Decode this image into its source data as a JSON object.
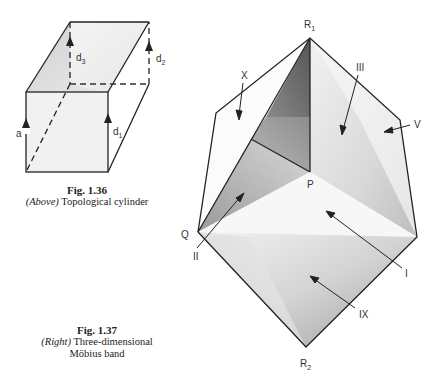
{
  "fig36": {
    "number": "Fig. 1.36",
    "qualifier": "(Above)",
    "title": "Topological cylinder",
    "labels": {
      "a": "a",
      "d1": "d",
      "d1_sub": "1",
      "d2": "d",
      "d2_sub": "2",
      "d3": "d",
      "d3_sub": "3"
    }
  },
  "fig37": {
    "number": "Fig. 1.37",
    "qualifier": "(Right)",
    "title_line1": "Three-dimensional",
    "title_line2": "Möbius band",
    "labels": {
      "R1": "R",
      "R1_sub": "1",
      "R2": "R",
      "R2_sub": "2",
      "P": "P",
      "Q": "Q",
      "X": "X",
      "III": "III",
      "V": "V",
      "II": "II",
      "I": "I",
      "IX": "IX"
    }
  }
}
